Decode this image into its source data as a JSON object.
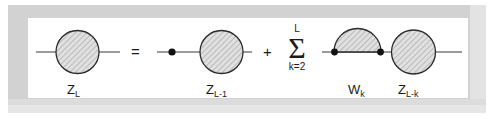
{
  "figure": {
    "kind": "recursion-diagram-equation",
    "frame": {
      "border_color": "#d2d2d2",
      "inner_background": "#ffffff"
    },
    "stroke_color": "#333333",
    "fill_pattern": "diagonal-hatch",
    "fill_color": "#cfcfcf",
    "terms": [
      {
        "id": "lhs",
        "label": "Z",
        "subscript": "L",
        "shape": "hatched-circle"
      },
      {
        "id": "rhs-term-1",
        "label": "Z",
        "subscript": "L-1",
        "shape": "hatched-circle-with-vertex-dot"
      },
      {
        "id": "rhs-term-2-blob",
        "label": "W",
        "subscript": "k",
        "shape": "hatched-semicircle"
      },
      {
        "id": "rhs-term-2-circle",
        "label": "Z",
        "subscript": "L-k",
        "shape": "hatched-circle"
      }
    ],
    "operators": {
      "equals": "=",
      "plus": "+"
    },
    "summation": {
      "symbol": "Σ",
      "upper_limit": "L",
      "lower_limit": "k=2"
    }
  }
}
